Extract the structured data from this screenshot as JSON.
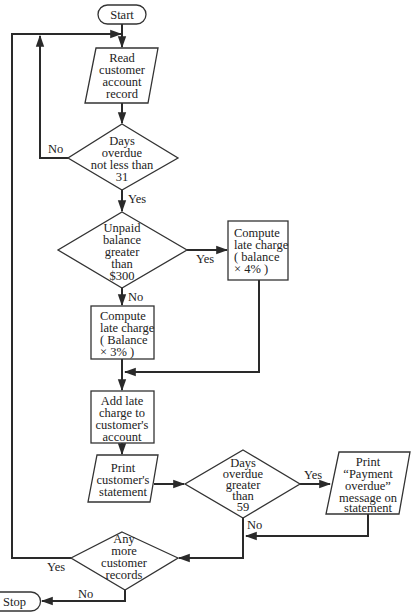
{
  "flowchart": {
    "start": "Start",
    "stop": "Stop",
    "read_record": [
      "Read",
      "customer",
      "account",
      "record"
    ],
    "decision_days31": [
      "Days",
      "overdue",
      "not less than",
      "31"
    ],
    "decision_balance": [
      "Unpaid",
      "balance",
      "greater",
      "than",
      "$300"
    ],
    "compute_4pct": [
      "Compute",
      "late charge",
      "( balance",
      "× 4% )"
    ],
    "compute_3pct": [
      "Compute",
      "late charge",
      "( Balance",
      "× 3% )"
    ],
    "add_charge": [
      "Add late",
      "charge to",
      "customer's",
      "account"
    ],
    "print_statement": [
      "Print",
      "customer's",
      "statement"
    ],
    "decision_days59": [
      "Days",
      "overdue",
      "greater",
      "than",
      "59"
    ],
    "print_overdue": [
      "Print",
      "“Payment",
      "overdue”",
      "message on",
      "statement"
    ],
    "decision_more": [
      "Any",
      "more",
      "customer",
      "records"
    ],
    "labels": {
      "no_days31": "No",
      "yes_days31": "Yes",
      "yes_balance": "Yes",
      "no_balance": "No",
      "yes_days59": "Yes",
      "no_days59": "No",
      "yes_more": "Yes",
      "no_more": "No"
    }
  }
}
